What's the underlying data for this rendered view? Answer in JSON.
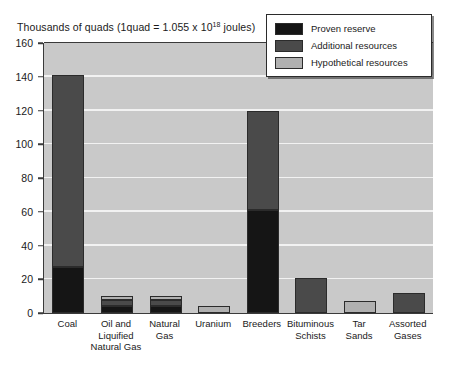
{
  "chart_data": {
    "type": "bar",
    "title_prefix": "Thousands of quads (1quad = 1.055 x 10",
    "title_superscript": "18",
    "title_suffix": " joules)",
    "xlabel": "",
    "ylabel": "",
    "ylim": [
      0,
      160
    ],
    "ytick_step": 20,
    "yticks": [
      0,
      20,
      40,
      60,
      80,
      100,
      120,
      140,
      160
    ],
    "ytick_labels": [
      "0",
      "20",
      "40",
      "60",
      "80",
      "100",
      "120",
      "140",
      "160"
    ],
    "grid": true,
    "grid_color": "#f2f2f2",
    "plot_background": "#c9c9c9",
    "stacked": true,
    "legend_position": "top-right",
    "categories": [
      "Coal",
      "Oil and Liquified Natural Gas",
      "Natural Gas",
      "Uranium",
      "Breeders",
      "Bituminous Schists",
      "Tar Sands",
      "Assorted Gases"
    ],
    "category_lines": [
      [
        "Coal"
      ],
      [
        "Oil and",
        "Liquified",
        "Natural Gas"
      ],
      [
        "Natural",
        "Gas"
      ],
      [
        "Uranium"
      ],
      [
        "Breeders"
      ],
      [
        "Bituminous",
        "Schists"
      ],
      [
        "Tar",
        "Sands"
      ],
      [
        "Assorted",
        "Gases"
      ]
    ],
    "series": [
      {
        "name": "Proven reserve",
        "color": "#151515",
        "values": [
          27,
          4,
          4,
          0,
          61,
          0,
          0,
          0
        ]
      },
      {
        "name": "Additional resources",
        "color": "#4a4a4a",
        "values": [
          114,
          4,
          4,
          0,
          59,
          21,
          0,
          12
        ]
      },
      {
        "name": "Hypothetical resources",
        "color": "#b0b0b0",
        "values": [
          0,
          2,
          2,
          4,
          0,
          0,
          7,
          0
        ]
      }
    ],
    "totals": [
      141,
      10,
      10,
      4,
      120,
      21,
      7,
      12
    ]
  },
  "legend": {
    "items": [
      {
        "label": "Proven reserve",
        "color": "#151515"
      },
      {
        "label": "Additional resources",
        "color": "#4a4a4a"
      },
      {
        "label": "Hypothetical resources",
        "color": "#b0b0b0"
      }
    ]
  }
}
